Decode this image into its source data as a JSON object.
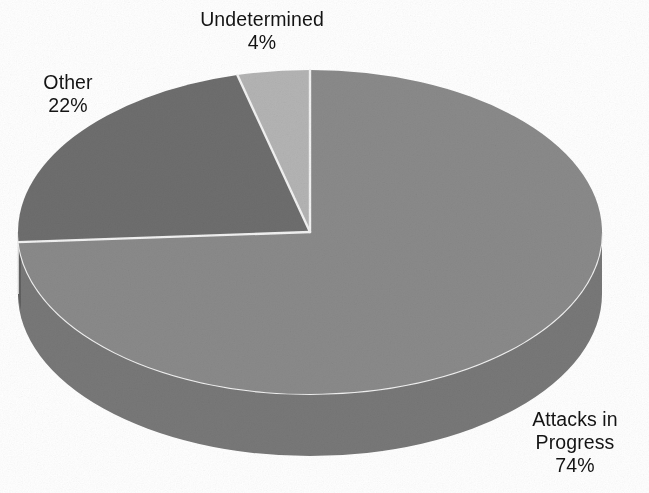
{
  "chart_data": {
    "type": "pie",
    "title": "",
    "subtitle": "",
    "xlabel": "",
    "ylabel": "",
    "legend_position": "none",
    "grid": false,
    "three_d": true,
    "start_angle_deg": 0,
    "direction": "clockwise",
    "units": "percent",
    "total": 100,
    "categories": [
      "Attacks in Progress",
      "Other",
      "Undetermined"
    ],
    "values": [
      74,
      22,
      4
    ],
    "slices": [
      {
        "label": "Attacks in Progress",
        "value": 74,
        "value_text": "74%",
        "color": "#8a8a8a",
        "side_color": "#787878",
        "start_deg": 0,
        "end_deg": 266.4
      },
      {
        "label": "Other",
        "value": 22,
        "value_text": "22%",
        "color": "#6e6e6e",
        "side_color": "#606060",
        "start_deg": 266.4,
        "end_deg": 345.6
      },
      {
        "label": "Undetermined",
        "value": 4,
        "value_text": "4%",
        "color": "#b4b4b4",
        "side_color": "#9e9e9e",
        "start_deg": 345.6,
        "end_deg": 360
      }
    ],
    "separator_color": "#f2f2f2",
    "background_color": "#ffffff",
    "text_color": "#141414"
  },
  "labels": {
    "undetermined": {
      "name": "Undetermined",
      "value": "4%"
    },
    "other": {
      "name": "Other",
      "value": "22%"
    },
    "attacks": {
      "name_line1": "Attacks in",
      "name_line2": "Progress",
      "value": "74%"
    }
  }
}
